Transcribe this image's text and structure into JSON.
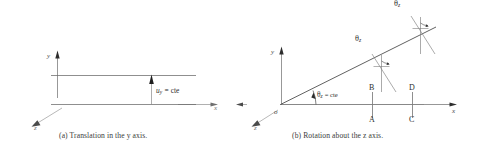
{
  "figure": {
    "panels": [
      {
        "id": "panel-a",
        "caption": "(a)  Translation in the y axis.",
        "axes": {
          "y_label": "y",
          "x_label": "x",
          "z_label": "z"
        },
        "annotation": {
          "symbol": "u",
          "subscript": "y",
          "relation": "= cte",
          "full": "u_y = cte"
        },
        "lines": 2
      },
      {
        "id": "panel-b",
        "caption": "(b)  Rotation about the z axis.",
        "axes": {
          "y_label": "y",
          "x_label": "x",
          "z_label": "z"
        },
        "origin_label": "o",
        "angle_at_origin": {
          "symbol": "θ",
          "subscript": "z",
          "relation": "= cte",
          "full": "θ_z = cte"
        },
        "angle_markers": [
          {
            "symbol": "θ",
            "subscript": "z",
            "full": "θ_z"
          },
          {
            "symbol": "θ",
            "subscript": "z",
            "full": "θ_z"
          }
        ],
        "points": [
          "B",
          "D",
          "A",
          "C"
        ]
      }
    ],
    "colors": {
      "ink": "#2d2d2d",
      "line": "#5c5c5c",
      "faint": "#9a9a9a",
      "background": "#ffffff"
    }
  }
}
